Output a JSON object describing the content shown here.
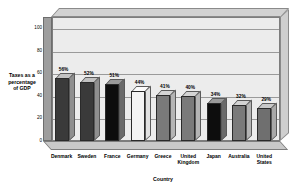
{
  "chart_data": {
    "type": "bar",
    "title": "",
    "xlabel": "Country",
    "ylabel": "Taxes as a percentage of GDP",
    "ylabel_lines": [
      "Taxes as a",
      "percentage",
      "of GDP"
    ],
    "categories": [
      "Denmark",
      "Sweden",
      "France",
      "Germany",
      "Greece",
      "United Kingdom",
      "Japan",
      "Australia",
      "United States"
    ],
    "category_lines": [
      [
        "Denmark"
      ],
      [
        "Sweden"
      ],
      [
        "France"
      ],
      [
        "Germany"
      ],
      [
        "Greece"
      ],
      [
        "United",
        "Kingdom"
      ],
      [
        "Japan"
      ],
      [
        "Australia"
      ],
      [
        "United",
        "States"
      ]
    ],
    "values": [
      56,
      52,
      51,
      44,
      41,
      40,
      34,
      32,
      29
    ],
    "data_labels": [
      "56%",
      "52%",
      "51%",
      "44%",
      "41%",
      "40%",
      "34%",
      "32%",
      "29%"
    ],
    "bar_colors": [
      "#3a3a3a",
      "#3a3a3a",
      "#0d0d0d",
      "#f4f4f4",
      "#7a7a7a",
      "#7a7a7a",
      "#0d0d0d",
      "#7a7a7a",
      "#6f6f6f"
    ],
    "bar_side_colors": [
      "#8f8f8f",
      "#8f8f8f",
      "#6a6a6a",
      "#e2e2e2",
      "#b4b4b4",
      "#b4b4b4",
      "#6a6a6a",
      "#b4b4b4",
      "#a8a8a8"
    ],
    "bar_top_colors": [
      "#c2c2c2",
      "#c2c2c2",
      "#9a9a9a",
      "#fbfbfb",
      "#d4d4d4",
      "#d4d4d4",
      "#9a9a9a",
      "#d4d4d4",
      "#c8c8c8"
    ],
    "ylim": [
      0,
      110
    ],
    "yticks": [
      0,
      20,
      40,
      60,
      80,
      100
    ],
    "ytick_labels": [
      "0",
      "20",
      "40",
      "60",
      "80",
      "100"
    ],
    "grid": true,
    "legend": false,
    "style": "3d-column",
    "plot_background": "#ececec",
    "wall_color": "#9e9e9e",
    "floor_color": "#c9c9c9"
  }
}
